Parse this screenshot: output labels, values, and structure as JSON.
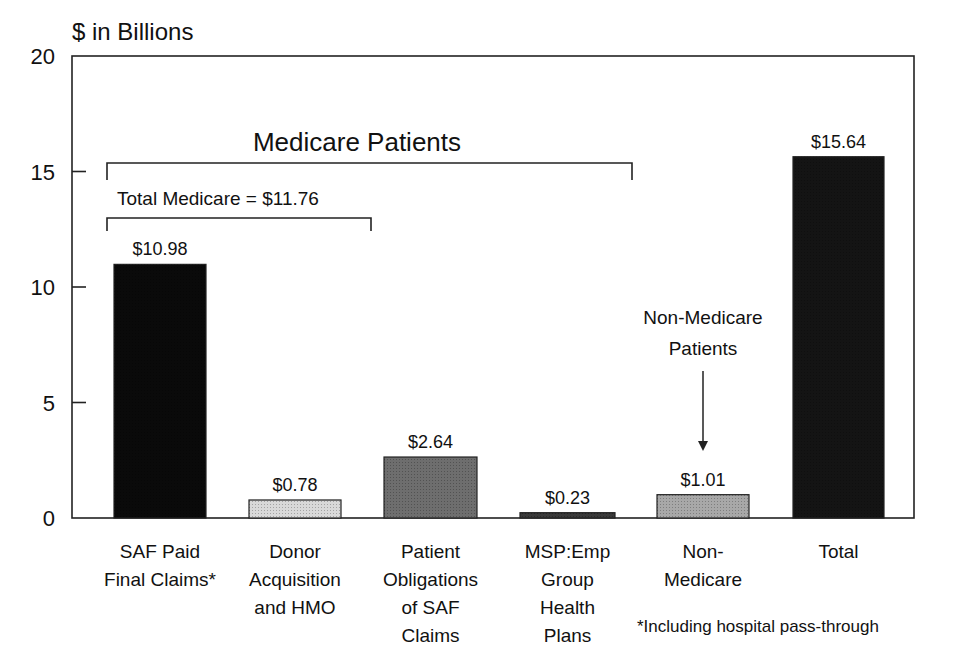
{
  "chart_data": {
    "type": "bar",
    "title": "",
    "ylabel": "$ in Billions",
    "xlabel": "",
    "ylim": [
      0,
      20
    ],
    "yticks": [
      0,
      5,
      10,
      15,
      20
    ],
    "grid": false,
    "legend": null,
    "categories": [
      "SAF Paid Final Claims*",
      "Donor Acquisition and HMO",
      "Patient Obligations of SAF Claims",
      "MSP:Emp Group Health Plans",
      "Non-Medicare",
      "Total"
    ],
    "category_lines": [
      [
        "SAF Paid",
        "Final Claims*"
      ],
      [
        "Donor",
        "Acquisition",
        "and HMO"
      ],
      [
        "Patient",
        "Obligations",
        "of SAF",
        "Claims"
      ],
      [
        "MSP:Emp",
        "Group",
        "Health",
        "Plans"
      ],
      [
        "Non-",
        "Medicare"
      ],
      [
        "Total"
      ]
    ],
    "values": [
      10.98,
      0.78,
      2.64,
      0.23,
      1.01,
      15.64
    ],
    "value_labels": [
      "$10.98",
      "$0.78",
      "$2.64",
      "$0.23",
      "$1.01",
      "$15.64"
    ],
    "bar_colors": [
      "#0a0a0a",
      "#d9d9d9",
      "#6e6e6e",
      "#3a3a3a",
      "#a8a8a8",
      "#141414"
    ],
    "annotations": {
      "medicare_patients": "Medicare Patients",
      "total_medicare": "Total Medicare = $11.76",
      "non_medicare_patients_line1": "Non-Medicare",
      "non_medicare_patients_line2": "Patients",
      "footnote": "*Including hospital pass-through"
    }
  }
}
